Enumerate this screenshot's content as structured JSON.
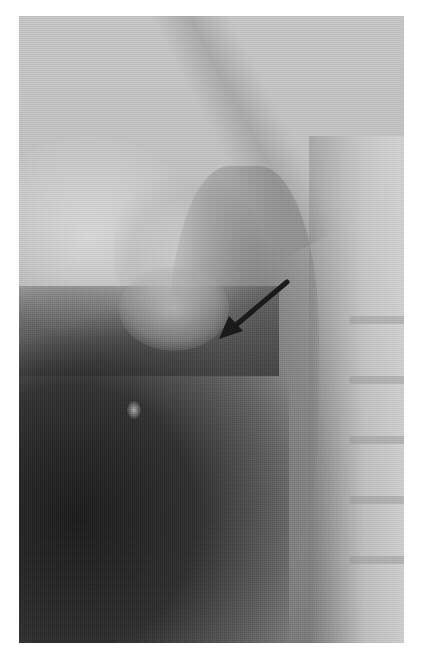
{
  "image": {
    "type": "grayscale radiograph",
    "frame": {
      "x": 19,
      "y": 16,
      "width": 385,
      "height": 627
    },
    "background_color": "#ffffff",
    "tones": {
      "light": "#d8d8d8",
      "mid": "#a8a8a8",
      "dark": "#1a1a1a"
    },
    "annotations": [
      {
        "kind": "arrow",
        "icon": "arrow-pointer-icon",
        "color": "#1a1a1a",
        "tail": {
          "x": 287,
          "y": 282
        },
        "tip": {
          "x": 219,
          "y": 339
        }
      }
    ]
  }
}
